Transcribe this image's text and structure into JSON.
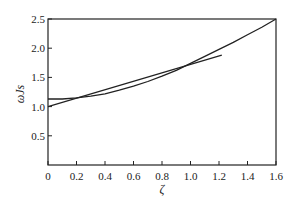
{
  "chart_data": {
    "type": "line",
    "title": "",
    "xlabel": "ζ",
    "ylabel": "ωJs",
    "xlim": [
      0,
      1.6
    ],
    "ylim": [
      0,
      2.5
    ],
    "x_ticks": [
      "0",
      "0.2",
      "0.4",
      "0.6",
      "0.8",
      "1.0",
      "1.2",
      "1.4",
      "1.6"
    ],
    "y_ticks": [
      "0.5",
      "1.0",
      "1.5",
      "2.0",
      "2.5"
    ],
    "grid": false,
    "legend": null,
    "series": [
      {
        "name": "curve",
        "x": [
          0,
          0.1,
          0.2,
          0.3,
          0.4,
          0.5,
          0.6,
          0.7,
          0.8,
          0.9,
          1.0,
          1.1,
          1.2,
          1.3,
          1.4,
          1.5,
          1.6
        ],
        "y": [
          1.13,
          1.13,
          1.15,
          1.18,
          1.22,
          1.28,
          1.35,
          1.43,
          1.52,
          1.62,
          1.74,
          1.86,
          1.98,
          2.1,
          2.23,
          2.36,
          2.5
        ]
      },
      {
        "name": "linear fit",
        "x": [
          0,
          1.22
        ],
        "y": [
          1.0,
          1.88
        ]
      }
    ]
  }
}
